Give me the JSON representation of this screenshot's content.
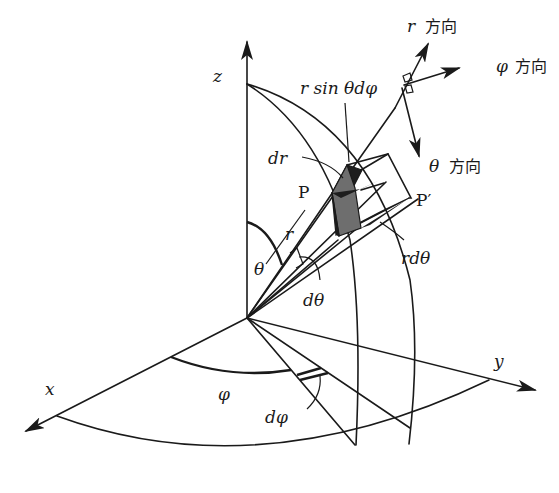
{
  "figure": {
    "colors": {
      "line": "#1a1a1a",
      "shade_dark": "#1e1e1e",
      "shade_mid": "#6e6e6e",
      "background": "#ffffff"
    }
  },
  "axes": {
    "x": {
      "label": "x"
    },
    "y": {
      "label": "y"
    },
    "z": {
      "label": "z"
    }
  },
  "directions": {
    "r": {
      "symbol": "r",
      "suffix": "方向"
    },
    "phi": {
      "symbol": "φ",
      "suffix": "方向"
    },
    "theta": {
      "symbol": "θ",
      "suffix": "方向"
    }
  },
  "labels": {
    "r_sin_theta_dphi": "r sin θdφ",
    "dr": "dr",
    "point_p": "P",
    "point_p_prime": "P′",
    "r": "r",
    "theta": "θ",
    "d_theta": "dθ",
    "r_d_theta": "rdθ",
    "phi": "φ",
    "d_phi": "dφ"
  }
}
